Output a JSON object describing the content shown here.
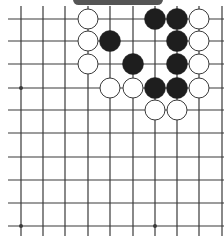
{
  "board": {
    "colors": {
      "line": "#3a3a3a",
      "black_stone": "#1e1e1e",
      "white_stone": "#ffffff",
      "white_outline": "#3a3a3a",
      "banner": "#555555"
    },
    "columns_x": [
      21,
      43,
      65,
      88,
      110,
      133,
      155,
      177,
      199,
      222
    ],
    "rows_y": [
      19,
      41,
      64,
      88,
      110,
      133,
      157,
      180,
      203,
      226
    ],
    "star_points": [
      [
        0,
        3
      ],
      [
        0,
        9
      ],
      [
        6,
        9
      ]
    ],
    "stones": [
      {
        "c": 3,
        "r": 0,
        "color": "white"
      },
      {
        "c": 6,
        "r": 0,
        "color": "black"
      },
      {
        "c": 7,
        "r": 0,
        "color": "black"
      },
      {
        "c": 8,
        "r": 0,
        "color": "white"
      },
      {
        "c": 3,
        "r": 1,
        "color": "white"
      },
      {
        "c": 4,
        "r": 1,
        "color": "black"
      },
      {
        "c": 7,
        "r": 1,
        "color": "black"
      },
      {
        "c": 8,
        "r": 1,
        "color": "white"
      },
      {
        "c": 3,
        "r": 2,
        "color": "white"
      },
      {
        "c": 5,
        "r": 2,
        "color": "black"
      },
      {
        "c": 7,
        "r": 2,
        "color": "black"
      },
      {
        "c": 8,
        "r": 2,
        "color": "white"
      },
      {
        "c": 4,
        "r": 3,
        "color": "white"
      },
      {
        "c": 5,
        "r": 3,
        "color": "white"
      },
      {
        "c": 6,
        "r": 3,
        "color": "black"
      },
      {
        "c": 7,
        "r": 3,
        "color": "black"
      },
      {
        "c": 8,
        "r": 3,
        "color": "white"
      },
      {
        "c": 6,
        "r": 4,
        "color": "white"
      },
      {
        "c": 7,
        "r": 4,
        "color": "white"
      }
    ]
  }
}
